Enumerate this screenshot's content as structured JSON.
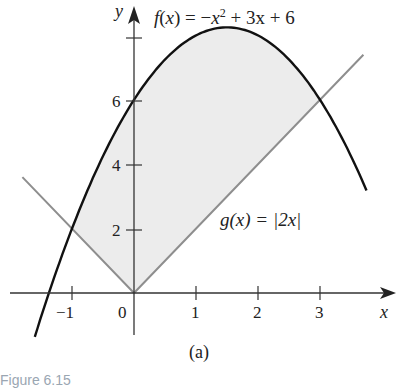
{
  "chart_data": {
    "type": "line",
    "title": "",
    "subtitle": "(a)",
    "xlabel": "x",
    "ylabel": "y",
    "xlim": [
      -2.1,
      4.3
    ],
    "ylim": [
      -2.0,
      9.3
    ],
    "x_ticks": [
      -1,
      0,
      1,
      2,
      3
    ],
    "x_tick_labels": [
      "−1",
      "0",
      "1",
      "2",
      "3"
    ],
    "y_ticks": [
      2,
      4,
      6,
      8
    ],
    "y_tick_labels": [
      "2",
      "4",
      "6",
      ""
    ],
    "grid": false,
    "legend": "none",
    "series": [
      {
        "name": "f(x) = −x² + 3x + 6",
        "expression": "-x^2 + 3x + 6",
        "color": "#111111",
        "x_range": [
          -1.6,
          3.75
        ],
        "points": [
          [
            -1.6,
            -1.36
          ],
          [
            -1.0,
            2.0
          ],
          [
            0,
            6.0
          ],
          [
            1.0,
            8.0
          ],
          [
            1.5,
            8.25
          ],
          [
            2.0,
            8.0
          ],
          [
            3.0,
            6.0
          ],
          [
            3.75,
            3.19
          ]
        ]
      },
      {
        "name": "g(x) = |2x|",
        "expression": "|2x|",
        "color": "#8e8e8e",
        "x_range": [
          -1.8,
          3.7
        ],
        "points": [
          [
            -1.8,
            3.6
          ],
          [
            -1.0,
            2.0
          ],
          [
            0,
            0
          ],
          [
            3.0,
            6.0
          ],
          [
            3.7,
            7.4
          ]
        ]
      }
    ],
    "shaded_region": {
      "between": [
        "f(x)",
        "g(x)"
      ],
      "x_from": -1,
      "x_to": 3,
      "color": "#ececec"
    },
    "annotations": [
      {
        "text": "f(x) = −x² + 3x + 6",
        "near": [
          2.2,
          9
        ]
      },
      {
        "text": "g(x) = |2x|",
        "near": [
          2.6,
          2.4
        ]
      }
    ]
  },
  "figure": {
    "f_label": {
      "f": "f",
      "open": "(",
      "x": "x",
      "close": ") = −",
      "x2": "x",
      "exp": "2",
      "rest": " + 3x + 6"
    },
    "g_label": "g(x) = |2x|",
    "x_axis_label": "x",
    "y_axis_label": "y",
    "panel_label": "(a)",
    "caption": "Figure 6.15"
  }
}
